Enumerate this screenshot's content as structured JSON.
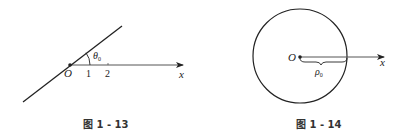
{
  "figures": [
    {
      "caption": "图 1 - 13",
      "origin_label": "O",
      "axis_label": "x",
      "angle_label": "θ",
      "angle_subscript": "0",
      "ticks": [
        "1",
        "2"
      ]
    },
    {
      "caption": "图 1 - 14",
      "origin_label": "O",
      "axis_label": "x",
      "radius_label": "ρ",
      "radius_subscript": "0"
    }
  ],
  "colors": {
    "stroke": "#222222",
    "axis": "#555555",
    "background": "#ffffff"
  }
}
